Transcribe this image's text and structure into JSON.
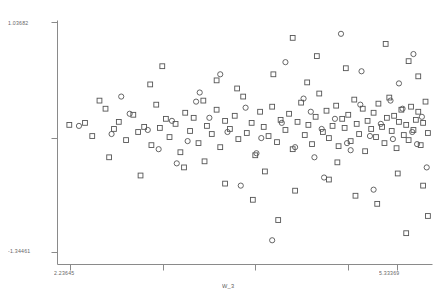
{
  "chart_data": {
    "type": "scatter",
    "title": "",
    "xlabel": "W_3",
    "ylabel": "",
    "xlim": [
      2.23645,
      5.33369
    ],
    "ylim": [
      -1.34461,
      1.03682
    ],
    "grid": false,
    "legend": "none",
    "x_tick_labels": [
      "2.23645",
      "5.33369"
    ],
    "y_tick_labels": [
      "1.03682",
      "-1.34461"
    ],
    "x_tick_values": [
      2.23645,
      5.33369
    ],
    "y_tick_values": [
      1.03682,
      -1.34461
    ],
    "series": [
      {
        "name": "squares",
        "marker": "square",
        "color": "#555555",
        "points": [
          [
            2.33,
            0.02
          ],
          [
            2.46,
            0.04
          ],
          [
            2.52,
            -0.09
          ],
          [
            2.63,
            0.18
          ],
          [
            2.7,
            -0.02
          ],
          [
            2.74,
            0.05
          ],
          [
            2.8,
            -0.13
          ],
          [
            2.86,
            0.12
          ],
          [
            2.9,
            -0.05
          ],
          [
            2.95,
            0.0
          ],
          [
            3.01,
            -0.18
          ],
          [
            3.05,
            0.22
          ],
          [
            3.08,
            -0.01
          ],
          [
            3.13,
            0.08
          ],
          [
            3.16,
            -0.1
          ],
          [
            3.21,
            0.03
          ],
          [
            3.25,
            -0.25
          ],
          [
            3.29,
            0.14
          ],
          [
            3.33,
            -0.04
          ],
          [
            3.36,
            0.09
          ],
          [
            3.4,
            -0.16
          ],
          [
            3.44,
            0.26
          ],
          [
            3.47,
            0.01
          ],
          [
            3.51,
            -0.07
          ],
          [
            3.55,
            0.17
          ],
          [
            3.58,
            -0.2
          ],
          [
            3.62,
            0.06
          ],
          [
            3.66,
            -0.02
          ],
          [
            3.7,
            0.11
          ],
          [
            3.73,
            -0.12
          ],
          [
            3.77,
            0.3
          ],
          [
            3.8,
            -0.06
          ],
          [
            3.84,
            0.04
          ],
          [
            3.87,
            -0.28
          ],
          [
            3.91,
            0.15
          ],
          [
            3.94,
            0.0
          ],
          [
            3.98,
            -0.09
          ],
          [
            4.01,
            0.2
          ],
          [
            4.05,
            -0.15
          ],
          [
            4.08,
            0.07
          ],
          [
            4.12,
            -0.03
          ],
          [
            4.15,
            0.13
          ],
          [
            4.18,
            -0.22
          ],
          [
            4.22,
            0.05
          ],
          [
            4.25,
            0.24
          ],
          [
            4.28,
            -0.08
          ],
          [
            4.31,
            0.02
          ],
          [
            4.34,
            -0.17
          ],
          [
            4.37,
            0.1
          ],
          [
            4.4,
            0.33
          ],
          [
            4.43,
            -0.05
          ],
          [
            4.46,
            0.16
          ],
          [
            4.48,
            -0.11
          ],
          [
            4.51,
            0.01
          ],
          [
            4.54,
            0.21
          ],
          [
            4.56,
            -0.19
          ],
          [
            4.59,
            0.08
          ],
          [
            4.61,
            -0.01
          ],
          [
            4.64,
            0.12
          ],
          [
            4.66,
            -0.14
          ],
          [
            4.69,
            0.27
          ],
          [
            4.71,
            0.03
          ],
          [
            4.73,
            -0.07
          ],
          [
            4.76,
            0.18
          ],
          [
            4.78,
            -0.24
          ],
          [
            4.8,
            0.06
          ],
          [
            4.83,
            -0.02
          ],
          [
            4.85,
            0.14
          ],
          [
            4.87,
            -0.1
          ],
          [
            4.89,
            0.23
          ],
          [
            4.92,
            0.0
          ],
          [
            4.94,
            -0.16
          ],
          [
            4.96,
            0.09
          ],
          [
            4.98,
            0.29
          ],
          [
            5.0,
            -0.04
          ],
          [
            5.02,
            0.11
          ],
          [
            5.04,
            -0.21
          ],
          [
            5.06,
            0.05
          ],
          [
            5.08,
            0.17
          ],
          [
            5.1,
            -0.08
          ],
          [
            5.12,
            0.02
          ],
          [
            5.14,
            -0.13
          ],
          [
            5.16,
            0.2
          ],
          [
            5.18,
            -0.03
          ],
          [
            5.2,
            0.07
          ],
          [
            5.22,
            0.15
          ],
          [
            5.24,
            -0.18
          ],
          [
            5.26,
            0.04
          ],
          [
            5.28,
            0.25
          ],
          [
            5.3,
            -0.06
          ],
          [
            3.1,
            0.6
          ],
          [
            3.55,
            0.46
          ],
          [
            4.38,
            0.7
          ],
          [
            4.62,
            0.58
          ],
          [
            4.95,
            0.82
          ],
          [
            5.14,
            0.65
          ],
          [
            5.22,
            0.5
          ],
          [
            4.3,
            0.44
          ],
          [
            3.72,
            0.38
          ],
          [
            4.02,
            0.52
          ],
          [
            2.92,
            -0.48
          ],
          [
            3.28,
            -0.4
          ],
          [
            3.62,
            -0.56
          ],
          [
            3.95,
            -0.44
          ],
          [
            4.2,
            -0.63
          ],
          [
            4.48,
            -0.52
          ],
          [
            4.7,
            -0.68
          ],
          [
            5.05,
            -0.46
          ],
          [
            5.26,
            -0.58
          ],
          [
            3.45,
            -0.34
          ],
          [
            4.06,
            -0.92
          ],
          [
            4.88,
            -0.76
          ],
          [
            5.3,
            -0.88
          ],
          [
            3.85,
            -0.72
          ],
          [
            4.55,
            -0.35
          ],
          [
            2.58,
            0.26
          ],
          [
            2.66,
            -0.3
          ],
          [
            3.0,
            0.42
          ],
          [
            5.12,
            -1.05
          ],
          [
            4.18,
            0.88
          ]
        ]
      },
      {
        "name": "circles",
        "marker": "circle",
        "color": "#555555",
        "points": [
          [
            2.41,
            0.01
          ],
          [
            2.68,
            -0.07
          ],
          [
            2.83,
            0.13
          ],
          [
            2.98,
            -0.03
          ],
          [
            3.18,
            0.06
          ],
          [
            3.31,
            -0.14
          ],
          [
            3.49,
            0.09
          ],
          [
            3.64,
            -0.05
          ],
          [
            3.79,
            0.19
          ],
          [
            3.92,
            -0.11
          ],
          [
            4.09,
            0.04
          ],
          [
            4.2,
            -0.2
          ],
          [
            4.33,
            0.15
          ],
          [
            4.42,
            -0.02
          ],
          [
            4.53,
            0.08
          ],
          [
            4.63,
            -0.16
          ],
          [
            4.74,
            0.22
          ],
          [
            4.82,
            -0.09
          ],
          [
            4.91,
            0.03
          ],
          [
            5.01,
            -0.12
          ],
          [
            5.09,
            0.18
          ],
          [
            5.17,
            -0.05
          ],
          [
            5.25,
            0.1
          ],
          [
            3.07,
            -0.22
          ],
          [
            3.38,
            0.25
          ],
          [
            3.88,
            -0.26
          ],
          [
            4.27,
            0.28
          ],
          [
            4.66,
            -0.23
          ],
          [
            4.99,
            0.26
          ],
          [
            5.21,
            -0.17
          ],
          [
            4.12,
            0.64
          ],
          [
            4.75,
            0.55
          ],
          [
            3.58,
            0.52
          ],
          [
            5.06,
            0.43
          ],
          [
            4.44,
            -0.5
          ],
          [
            3.75,
            -0.58
          ],
          [
            4.85,
            -0.62
          ],
          [
            5.29,
            -0.4
          ],
          [
            2.76,
            0.3
          ],
          [
            3.22,
            -0.36
          ],
          [
            4.58,
            0.92
          ],
          [
            4.01,
            -1.12
          ],
          [
            5.18,
            0.72
          ],
          [
            3.41,
            0.34
          ],
          [
            4.36,
            -0.3
          ]
        ]
      }
    ]
  },
  "axes": {
    "y_top_label": "1.03682",
    "y_bottom_label": "-1.34461",
    "x_left_label": "2.23645",
    "x_right_label": "5.33369",
    "x_axis_title": "W_3"
  },
  "colors": {
    "axis": "#8a8a8a",
    "marker": "#555555",
    "background": "#ffffff",
    "text": "#4a4a4a"
  }
}
